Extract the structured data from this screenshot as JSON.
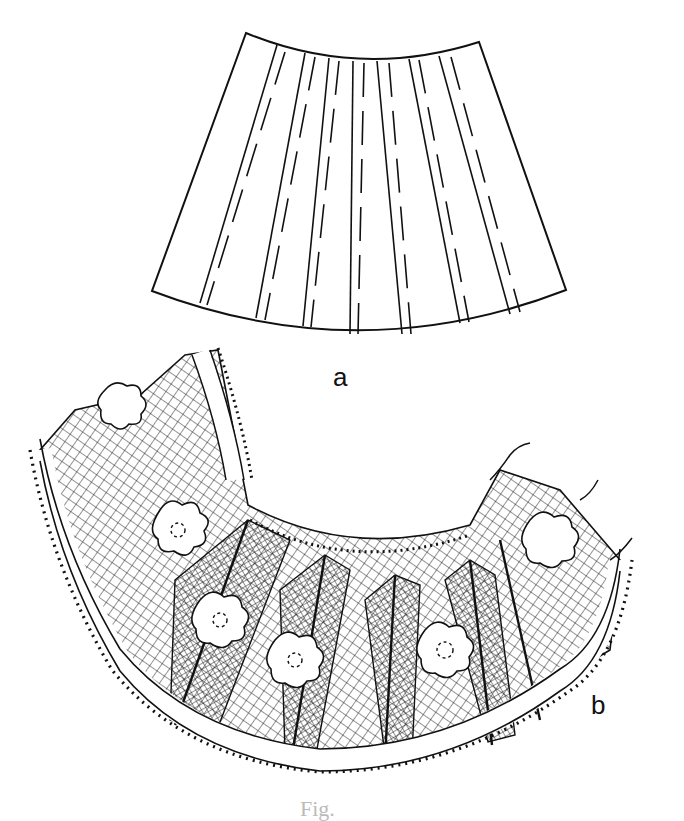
{
  "figure": {
    "parts": [
      {
        "id": "a",
        "label": "a",
        "description": "Fan-shaped pattern piece with pleat lines (solid fold lines paired with dashed placement lines)"
      },
      {
        "id": "b",
        "label": "b",
        "description": "Pleated lace collar with net ground, floral motifs and picot edging"
      }
    ],
    "caption": "Fig."
  },
  "colors": {
    "ink": "#111111",
    "paper": "#ffffff"
  }
}
